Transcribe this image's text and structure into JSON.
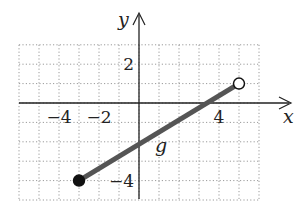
{
  "chart_data": {
    "type": "line",
    "title": "",
    "xlabel": "x",
    "ylabel": "y",
    "xlim": [
      -6,
      6
    ],
    "ylim": [
      -5,
      3
    ],
    "grid": true,
    "x_ticks_labeled": [
      {
        "value": -4,
        "label": "−4"
      },
      {
        "value": -2,
        "label": "−2"
      },
      {
        "value": 4,
        "label": "4"
      }
    ],
    "y_ticks_labeled": [
      {
        "value": 2,
        "label": "2"
      },
      {
        "value": -4,
        "label": "−4"
      }
    ],
    "series": [
      {
        "name": "g",
        "label": "g",
        "points": [
          {
            "x": -3,
            "y": -4
          },
          {
            "x": 5,
            "y": 1
          }
        ],
        "start_endpoint": "closed",
        "end_endpoint": "open",
        "color": "#555555"
      }
    ],
    "annotations": [
      {
        "text": "g",
        "x": 0.9,
        "y": -2.3
      }
    ]
  },
  "colors": {
    "axis": "#222222",
    "grid": "#9a9a9a",
    "line": "#555555",
    "curve_label": "#777777"
  }
}
